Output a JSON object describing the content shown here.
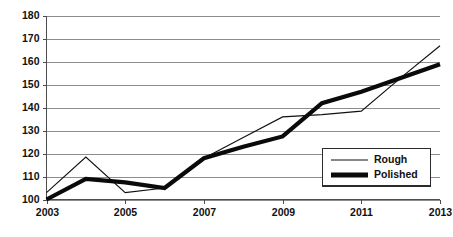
{
  "chart_data": {
    "type": "line",
    "title": "",
    "xlabel": "",
    "ylabel": "",
    "x": [
      2003,
      2004,
      2005,
      2006,
      2007,
      2008,
      2009,
      2010,
      2011,
      2012,
      2013
    ],
    "xlim": [
      2003,
      2013
    ],
    "ylim": [
      100,
      180
    ],
    "ytick_values": [
      100,
      110,
      120,
      130,
      140,
      150,
      160,
      170,
      180
    ],
    "ytick_labels": [
      "100",
      "110",
      "120",
      "130",
      "140",
      "150",
      "160",
      "170",
      "180"
    ],
    "xtick_values": [
      2003,
      2005,
      2007,
      2009,
      2011,
      2013
    ],
    "xtick_labels": [
      "2003",
      "2005",
      "2007",
      "2009",
      "2011",
      "2013"
    ],
    "grid": true,
    "grid_axis": "y",
    "legend_position": "bottom-right",
    "series": [
      {
        "name": "Rough",
        "style": "thin-line",
        "color": "#111111",
        "values": [
          103,
          118.5,
          103,
          105,
          118,
          127,
          136,
          137,
          138.5,
          153,
          167
        ]
      },
      {
        "name": "Polished",
        "style": "thick-line",
        "color": "#0a0a0a",
        "values": [
          100,
          109,
          107.5,
          105,
          118,
          123,
          127.5,
          142,
          147,
          153,
          159
        ]
      }
    ]
  },
  "legend": {
    "entries": [
      {
        "label": "Rough"
      },
      {
        "label": "Polished"
      }
    ]
  },
  "axes": {
    "y_axis_name": "value-axis",
    "x_axis_name": "year-axis"
  }
}
